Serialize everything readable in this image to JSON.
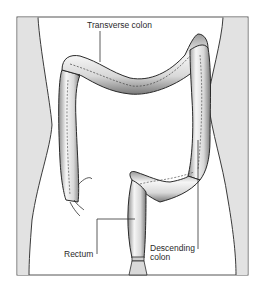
{
  "diagram": {
    "labels": {
      "transverse": "Transverse colon",
      "rectum": "Rectum",
      "descending_line1": "Descending",
      "descending_line2": "colon"
    },
    "colors": {
      "background": "#ffffff",
      "side_panels": "#e2e2e2",
      "outline": "#3a3a3a",
      "colon_fill": "#f4f4f4",
      "colon_shade": "#9a9a9a"
    }
  }
}
